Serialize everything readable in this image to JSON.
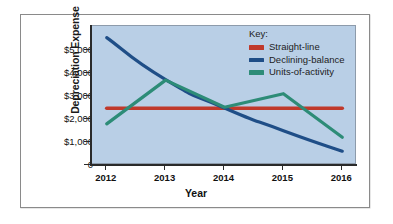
{
  "chart_data": {
    "type": "line",
    "title": "",
    "xlabel": "Year",
    "ylabel": "Depreciation Expense",
    "categories": [
      "2012",
      "2013",
      "2014",
      "2015",
      "2016"
    ],
    "x": [
      2012,
      2013,
      2014,
      2015,
      2016
    ],
    "ylim": [
      0,
      5750
    ],
    "xlim": [
      2011.75,
      2016.25
    ],
    "yticks": [
      0,
      1000,
      2000,
      3000,
      4000,
      5000
    ],
    "ytick_labels": [
      "0",
      "$1,000",
      "$2,000",
      "$3,000",
      "$4,000",
      "$5,000"
    ],
    "xtick_labels": [
      "2012",
      "2013",
      "2014",
      "2015",
      "2016"
    ],
    "grid": false,
    "legend_position": "top-right",
    "legend_title": "Key:",
    "plot_background": "#b9cfe6",
    "series": [
      {
        "name": "Straight-line",
        "color": "#c0392b",
        "values": [
          2350,
          2350,
          2350,
          2350,
          2350
        ],
        "style": "straight"
      },
      {
        "name": "Declining-balance",
        "color": "#1f4e87",
        "values": [
          5270,
          3530,
          2360,
          1420,
          570
        ],
        "style": "curved"
      },
      {
        "name": "Units-of-activity",
        "color": "#2d8c77",
        "values": [
          1700,
          3510,
          2390,
          2950,
          1150
        ],
        "style": "straight"
      }
    ]
  },
  "axes": {
    "ylabel": "Depreciation Expense",
    "xlabel": "Year",
    "ytick_labels": [
      "$5,000",
      "$4,000",
      "$3,000",
      "$2,000",
      "$1,000",
      "0"
    ],
    "xtick_labels": [
      "2012",
      "2013",
      "2014",
      "2015",
      "2016"
    ]
  },
  "legend": {
    "title": "Key:",
    "entries": [
      {
        "label": "Straight-line",
        "color": "#c0392b"
      },
      {
        "label": "Declining-balance",
        "color": "#1f4e87"
      },
      {
        "label": "Units-of-activity",
        "color": "#2d8c77"
      }
    ]
  }
}
